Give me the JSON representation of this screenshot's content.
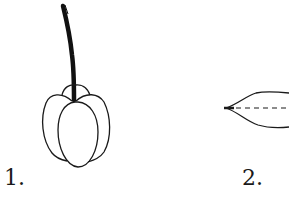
{
  "figures": [
    {
      "id": "1",
      "label": "1.",
      "depicts": "lobed capsule fruit hanging from a dark stalk"
    },
    {
      "id": "2",
      "label": "2.",
      "depicts": "lens-shaped outline with dashed midline, pointed tip at left, cropped at right edge"
    }
  ],
  "colors": {
    "background": "#ffffff",
    "ink": "#1a1a1a"
  }
}
